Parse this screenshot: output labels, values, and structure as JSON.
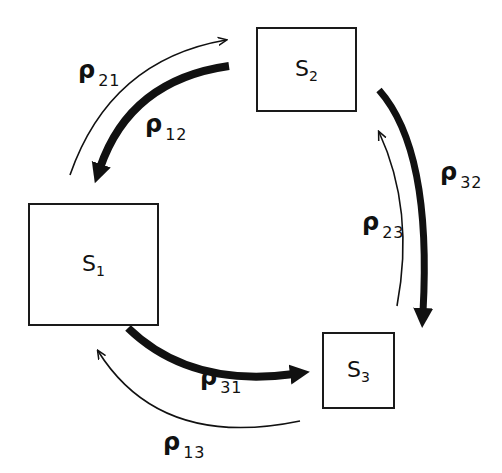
{
  "diagram": {
    "type": "state-transition-cycle",
    "nodes": [
      {
        "id": "S1",
        "symbol": "S",
        "subscript": "1"
      },
      {
        "id": "S2",
        "symbol": "S",
        "subscript": "2"
      },
      {
        "id": "S3",
        "symbol": "S",
        "subscript": "3"
      }
    ],
    "edges": [
      {
        "id": "rho12",
        "symbol": "ρ",
        "subscript": "12",
        "from": "S2",
        "to": "S1",
        "weight": "thick"
      },
      {
        "id": "rho21",
        "symbol": "ρ",
        "subscript": "21",
        "from": "S1",
        "to": "S2",
        "weight": "thin"
      },
      {
        "id": "rho32",
        "symbol": "ρ",
        "subscript": "32",
        "from": "S2",
        "to": "S3",
        "weight": "thick"
      },
      {
        "id": "rho23",
        "symbol": "ρ",
        "subscript": "23",
        "from": "S3",
        "to": "S2",
        "weight": "thin"
      },
      {
        "id": "rho31",
        "symbol": "ρ",
        "subscript": "31",
        "from": "S1",
        "to": "S3",
        "weight": "thick"
      },
      {
        "id": "rho13",
        "symbol": "ρ",
        "subscript": "13",
        "from": "S3",
        "to": "S1",
        "weight": "thin"
      }
    ]
  },
  "colors": {
    "ink": "#111111",
    "background": "#ffffff"
  }
}
